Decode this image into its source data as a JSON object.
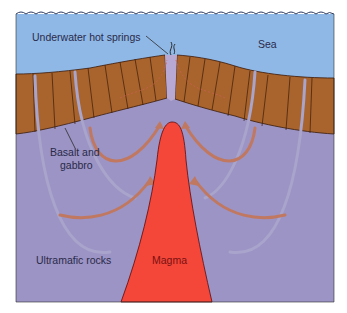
{
  "labels": {
    "hot_springs": "Underwater hot springs",
    "sea": "Sea",
    "basalt_line1": "Basalt and",
    "basalt_line2": "gabbro",
    "ultramafic": "Ultramafic rocks",
    "magma": "Magma"
  },
  "colors": {
    "sea": "#8fb8e6",
    "crust": "#a8642c",
    "mantle": "#9c94c4",
    "magma": "#f4473a",
    "circulation_hot": "#c07860",
    "circulation_cold": "#a8a4cc"
  }
}
